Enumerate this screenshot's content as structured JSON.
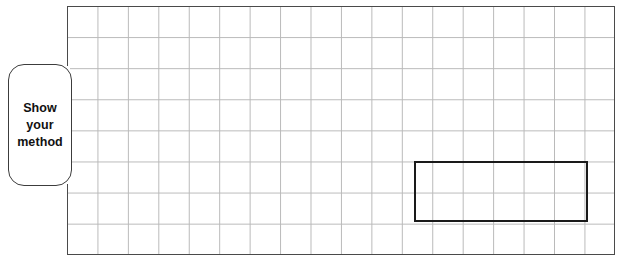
{
  "worksheet": {
    "callout": {
      "name": "show-your-method-callout",
      "lines": [
        "Show",
        "your",
        "method"
      ]
    },
    "grid": {
      "name": "answer-grid",
      "columns": 18,
      "rows": 8,
      "cell_width_px": 30.45,
      "cell_height_px": 31.1,
      "line_color": "#b9b9b9",
      "border_color": "#4a4a4a"
    },
    "drawn_shape": {
      "name": "answer-rectangle",
      "type": "rectangle",
      "stroke_color": "#1a1a1a",
      "fill": "none",
      "width_cells": 6,
      "height_cells": 2,
      "left_px": 414,
      "top_px": 161,
      "width_px": 174,
      "height_px": 61
    }
  }
}
